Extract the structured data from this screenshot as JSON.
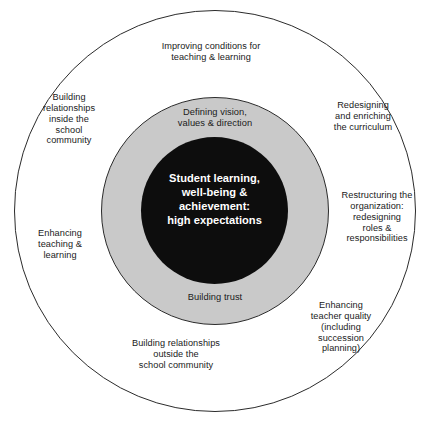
{
  "diagram": {
    "colors": {
      "outer_ring_fill": "#ffffff",
      "middle_ring_fill": "#c9c9c9",
      "core_fill": "#0d0d0d",
      "stroke": "#2b2b2b",
      "text": "#1a1a1a",
      "core_text": "#ffffff"
    },
    "core": {
      "text": "Student learning,\nwell-being &\nachievement:\nhigh expectations"
    },
    "middle_ring": {
      "labels": [
        {
          "id": "vision",
          "text": "Defining vision,\nvalues & direction"
        },
        {
          "id": "trust",
          "text": "Building trust"
        }
      ]
    },
    "outer_ring": {
      "labels": [
        {
          "id": "improving",
          "text": "Improving conditions for\nteaching & learning"
        },
        {
          "id": "inside",
          "text": "Building\nrelationships\ninside the\nschool\ncommunity"
        },
        {
          "id": "redesigning",
          "text": "Redesigning\nand enriching\nthe curriculum"
        },
        {
          "id": "restructuring",
          "text": "Restructuring the\norganization:\nredesigning\nroles &\nresponsibilities"
        },
        {
          "id": "enhancing_teaching",
          "text": "Enhancing\nteaching &\nlearning"
        },
        {
          "id": "teacher_quality",
          "text": "Enhancing\nteacher quality\n(including\nsuccession\nplanning)"
        },
        {
          "id": "outside",
          "text": "Building relationships\noutside the\nschool community"
        }
      ]
    }
  }
}
